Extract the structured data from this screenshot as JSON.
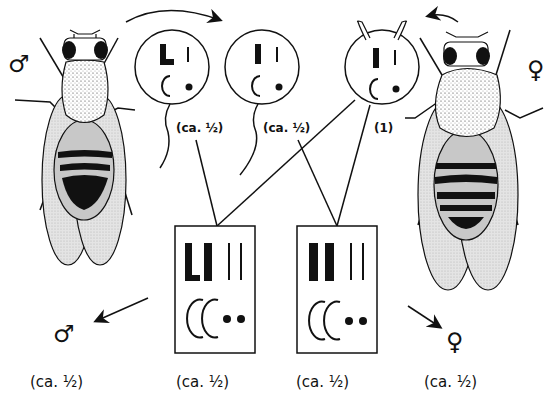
{
  "diagram": {
    "type": "genetic cross diagram (Drosophila sex-chromosome inheritance)",
    "parents": {
      "male": {
        "symbol": "♂",
        "label": "male fly",
        "abdomen": "dark tip"
      },
      "female": {
        "symbol": "♀",
        "label": "female fly",
        "abdomen": "striped"
      }
    },
    "gametes": [
      {
        "id": "sperm-1",
        "kind": "sperm",
        "chromosomes": "L I / C •",
        "fraction": "(ca. ½)"
      },
      {
        "id": "sperm-2",
        "kind": "sperm",
        "chromosomes": "I I / C •",
        "fraction": "(ca. ½)"
      },
      {
        "id": "egg",
        "kind": "egg",
        "chromosomes": "I I / C •",
        "fraction": "(1)"
      }
    ],
    "offspring": [
      {
        "id": "zygote-male",
        "karyotype": "L I I I / C C • •",
        "sex_symbol": "♂",
        "fraction": "(ca. ½)"
      },
      {
        "id": "zygote-female",
        "karyotype": "I I I I / C C • •",
        "sex_symbol": "♀",
        "fraction": "(ca. ½)"
      }
    ],
    "bottom_labels": [
      "(ca. ½)",
      "(ca. ½)",
      "(ca. ½)",
      "(ca. ½)"
    ],
    "gamete_labels": [
      "(ca. ½)",
      "(ca. ½)",
      "(1)"
    ],
    "sex_symbols": {
      "male_top": "♂",
      "female_top": "♀",
      "male_bottom": "♂",
      "female_bottom": "♀"
    }
  }
}
